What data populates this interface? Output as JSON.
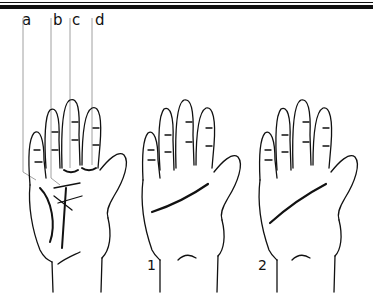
{
  "figure": {
    "type": "palmistry-diagram",
    "line_color": "#111111",
    "background": "#ffffff",
    "pointer_labels": [
      {
        "id": "a",
        "text": "a"
      },
      {
        "id": "b",
        "text": "b"
      },
      {
        "id": "c",
        "text": "c"
      },
      {
        "id": "d",
        "text": "d"
      }
    ],
    "hands": [
      {
        "id": "reference",
        "number_label": "",
        "description": "Hand with pointer lines a-d to finger bases and crossing palm lines"
      },
      {
        "id": "hand-1",
        "number_label": "1",
        "description": "Hand with a short curved heart line"
      },
      {
        "id": "hand-2",
        "number_label": "2",
        "description": "Hand with a long diagonal line"
      }
    ]
  }
}
